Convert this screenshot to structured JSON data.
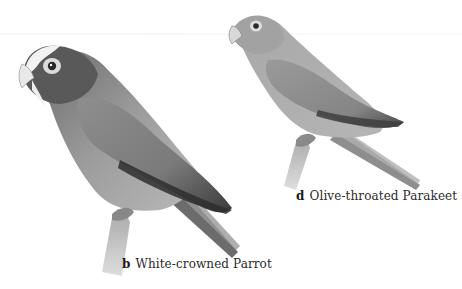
{
  "illustration": {
    "style": "grayscale natural-history plate",
    "background": "#ffffff"
  },
  "birds": [
    {
      "letter": "b",
      "name": "White-crowned Parrot",
      "position": "left",
      "colors": {
        "head": "#5a5a5a",
        "crown": "#f0f0f0",
        "body": "#9a9a9a",
        "wing": "#7a7a7a",
        "wing_dark": "#3c3c3c",
        "branch": "#b5b5b5"
      }
    },
    {
      "letter": "d",
      "name": "Olive-throated Parakeet",
      "position": "right",
      "colors": {
        "head": "#a5a5a5",
        "body": "#a0a0a0",
        "wing": "#8a8a8a",
        "wing_dark": "#4a4a4a",
        "branch": "#b0b0b0"
      }
    }
  ]
}
